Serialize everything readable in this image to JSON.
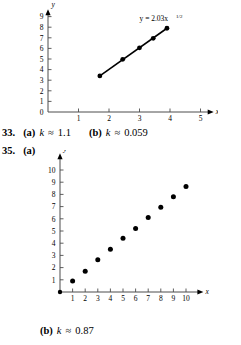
{
  "page": {
    "width": 241,
    "height": 345,
    "background": "#ffffff",
    "text_color": "#000000"
  },
  "answers": [
    {
      "id": "answer-33",
      "number": "33.",
      "parts": [
        {
          "label": "(a)",
          "variable": "k",
          "relation": "≈",
          "value": "1.1"
        },
        {
          "label": "(b)",
          "variable": "k",
          "relation": "≈",
          "value": "0.059"
        }
      ]
    },
    {
      "id": "answer-35",
      "number": "35.",
      "parts": [
        {
          "label": "(a)",
          "variable": "",
          "relation": "",
          "value": ""
        },
        {
          "label": "(b)",
          "variable": "k",
          "relation": "≈",
          "value": "0.87"
        }
      ]
    }
  ],
  "chart_data": [
    {
      "id": "chart-33b",
      "type": "scatter",
      "title": "",
      "annotation": {
        "text": "y = 2.03x",
        "exponent": "1/2",
        "x": 3.0,
        "y": 8.6
      },
      "xlabel": "x",
      "xlabel_exponent": "1/2",
      "ylabel": "y",
      "ylabel_exponent": "",
      "xlim": [
        0.0,
        5.4
      ],
      "ylim": [
        0,
        9.6
      ],
      "xticks": [
        1,
        2,
        3,
        4,
        5
      ],
      "yticks": [
        0,
        1,
        2,
        3,
        4,
        5,
        6,
        7,
        8,
        9
      ],
      "grid": false,
      "legend": "none",
      "x": [
        1.7,
        2.45,
        3.0,
        3.45,
        3.9
      ],
      "y": [
        3.4,
        4.97,
        6.05,
        6.95,
        7.9
      ],
      "fit_line": {
        "from_x": 1.7,
        "from_y": 3.4,
        "to_x": 3.9,
        "to_y": 7.9
      },
      "marker": "filled-circle",
      "marker_color": "#000000",
      "line_color": "#000000"
    },
    {
      "id": "chart-35a",
      "type": "scatter",
      "title": "",
      "xlabel": "x",
      "xlabel_exponent": "",
      "ylabel": "y",
      "ylabel_exponent": "",
      "xlim": [
        0,
        11.3
      ],
      "ylim": [
        0,
        11.3
      ],
      "xticks": [
        0,
        1,
        2,
        3,
        4,
        5,
        6,
        7,
        8,
        9,
        10
      ],
      "yticks": [
        1,
        2,
        3,
        4,
        5,
        6,
        7,
        8,
        9,
        10
      ],
      "grid": false,
      "legend": "none",
      "x": [
        0,
        1,
        2,
        3,
        4,
        5,
        6,
        7,
        8,
        9,
        10
      ],
      "y": [
        0,
        0.9,
        1.7,
        2.65,
        3.5,
        4.4,
        5.2,
        6.1,
        6.95,
        7.8,
        8.65
      ],
      "marker": "filled-circle",
      "marker_color": "#000000"
    }
  ]
}
